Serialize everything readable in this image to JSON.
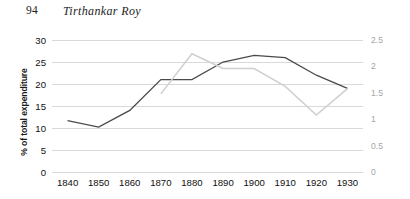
{
  "page": {
    "number": "94",
    "running_title": "Tirthankar Roy"
  },
  "chart_data": {
    "type": "line",
    "title": "",
    "xlabel": "",
    "ylabel": "% of total expenditure",
    "y2label": "",
    "grid": true,
    "legend": "none",
    "categories": [
      "1840",
      "1850",
      "1860",
      "1870",
      "1880",
      "1890",
      "1900",
      "1910",
      "1920",
      "1930"
    ],
    "ylim": [
      0,
      30
    ],
    "yticks": [
      "0",
      "5",
      "10",
      "15",
      "20",
      "25",
      "30"
    ],
    "ylim_right": [
      0,
      2.5
    ],
    "yticks_right": [
      "0",
      "0.5",
      "1",
      "1.5",
      "2",
      "2.5"
    ],
    "series": [
      {
        "name": "primary-dark-series",
        "axis": "left",
        "color": "#4a4a4a",
        "width": 1.3,
        "values": [
          11.7,
          10.2,
          14.0,
          21.0,
          21.0,
          25.0,
          26.5,
          26.0,
          22.0,
          19.0
        ]
      },
      {
        "name": "secondary-light-series",
        "axis": "right",
        "color": "#cfcfcf",
        "width": 1.5,
        "values": [
          null,
          null,
          null,
          1.48,
          2.24,
          1.96,
          1.96,
          1.62,
          1.08,
          1.58
        ]
      }
    ]
  }
}
